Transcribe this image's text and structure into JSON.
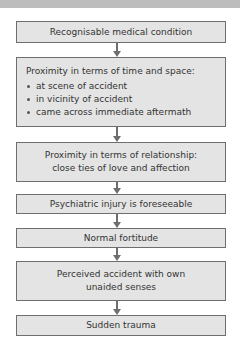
{
  "diagram": {
    "type": "flowchart",
    "direction": "top-to-bottom",
    "nodes": [
      {
        "id": "n1",
        "text": "Recognisable medical condition"
      },
      {
        "id": "n2",
        "text": "Proximity in terms of time and space:",
        "bullets": [
          "at scene of accident",
          "in vicinity of accident",
          "came across immediate aftermath"
        ]
      },
      {
        "id": "n3",
        "line1": "Proximity in terms of relationship:",
        "line2": "close ties of love and affection"
      },
      {
        "id": "n4",
        "text": "Psychiatric injury is foreseeable"
      },
      {
        "id": "n5",
        "text": "Normal fortitude"
      },
      {
        "id": "n6",
        "line1": "Perceived accident with own",
        "line2": "unaided senses"
      },
      {
        "id": "n7",
        "text": "Sudden trauma"
      }
    ],
    "edges": [
      {
        "from": "n1",
        "to": "n2"
      },
      {
        "from": "n2",
        "to": "n3"
      },
      {
        "from": "n3",
        "to": "n4"
      },
      {
        "from": "n4",
        "to": "n5"
      },
      {
        "from": "n5",
        "to": "n6"
      },
      {
        "from": "n6",
        "to": "n7"
      }
    ],
    "colors": {
      "box_fill": "#e4e4e4",
      "box_border": "#6e6e6e",
      "arrow": "#6e6e6e",
      "text": "#333333",
      "top_band": "#bdbdbd"
    }
  }
}
